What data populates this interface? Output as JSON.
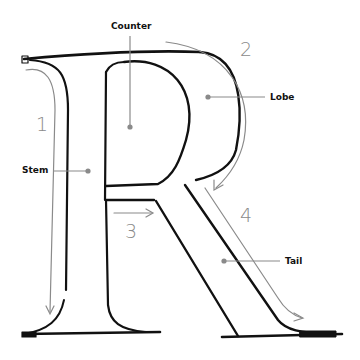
{
  "diagram": {
    "letter": "R",
    "parts": [
      {
        "name": "Counter"
      },
      {
        "name": "Lobe"
      },
      {
        "name": "Stem"
      },
      {
        "name": "Tail"
      }
    ],
    "stroke_order": [
      "1",
      "2",
      "3",
      "4"
    ],
    "colors": {
      "outline": "#111111",
      "annotation": "#8a8a8a",
      "label": "#111111"
    }
  }
}
